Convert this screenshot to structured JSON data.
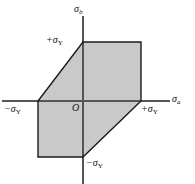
{
  "figure": {
    "type": "diagram",
    "background": "#ffffff",
    "fill_color": "#c9c9c9",
    "line_color": "#1a1a1a",
    "axis_color": "#555555"
  },
  "axes": {
    "vertical_label": "σ",
    "vertical_sub": "b",
    "horizontal_label": "σ",
    "horizontal_sub": "a",
    "origin_label": "O"
  },
  "ticks": {
    "top_positive": "+σ",
    "top_positive_sub": "Y",
    "left_negative": "−σ",
    "left_negative_sub": "Y",
    "right_positive": "+σ",
    "right_positive_sub": "Y",
    "bottom_negative": "−σ",
    "bottom_negative_sub": "Y"
  },
  "chart_data": {
    "type": "line",
    "xlabel": "sigma_a",
    "ylabel": "sigma_b",
    "xlim": [
      -1.5,
      1.5
    ],
    "ylim": [
      -1.5,
      1.5
    ],
    "grid": false,
    "legend": "none",
    "tick_labels_x": [
      "-σY",
      "0",
      "+σY"
    ],
    "tick_labels_y": [
      "-σY",
      "0",
      "+σY"
    ],
    "series": [
      {
        "name": "yield-hexagon",
        "closed": true,
        "points": [
          [
            1,
            1
          ],
          [
            0,
            1
          ],
          [
            -1,
            0
          ],
          [
            -1,
            -1
          ],
          [
            0,
            -1
          ],
          [
            1,
            0
          ]
        ]
      }
    ]
  },
  "geometry": {
    "origin_px": [
      83,
      101
    ],
    "unit_px_x": 58,
    "unit_px_y": 59,
    "hexagon_px": [
      [
        141,
        42
      ],
      [
        83,
        42
      ],
      [
        38,
        101
      ],
      [
        38,
        157
      ],
      [
        83,
        157
      ],
      [
        141,
        101
      ]
    ],
    "vertical_axis_px": {
      "x": 83,
      "y1": 16,
      "y2": 184
    },
    "horizontal_axis_px": {
      "y": 101,
      "x1": 2,
      "x2": 170
    }
  }
}
